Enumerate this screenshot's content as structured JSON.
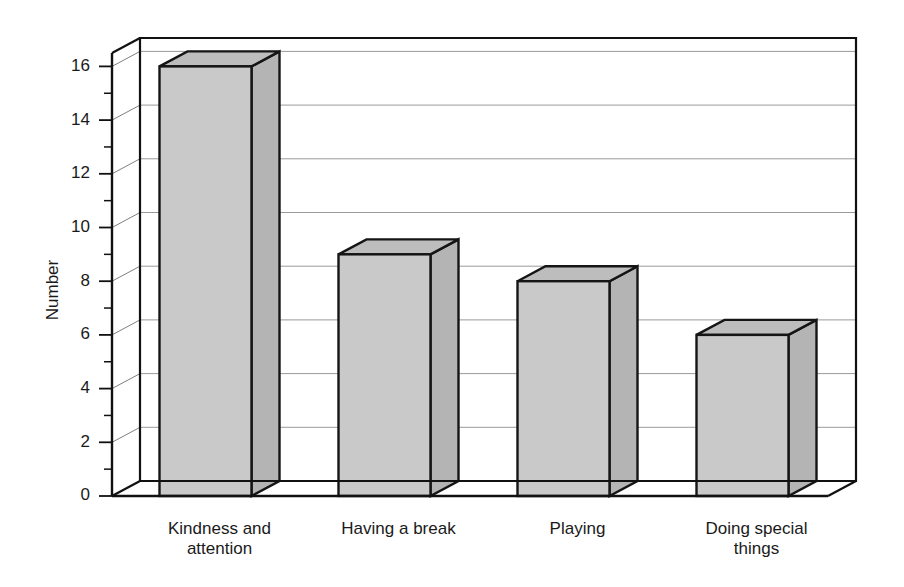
{
  "chart_data": {
    "type": "bar",
    "title": "",
    "subtitle": "",
    "xlabel": "",
    "ylabel": "Number",
    "categories": [
      "Kindness and attention",
      "Having a break",
      "Playing",
      "Doing special things"
    ],
    "category_lines": [
      [
        "Kindness and",
        "attention"
      ],
      [
        "Having a break"
      ],
      [
        "Playing"
      ],
      [
        "Doing special",
        "things"
      ]
    ],
    "values": [
      16,
      9,
      8,
      6
    ],
    "ylim": [
      0,
      16
    ],
    "y_axis_max_drawn": 16.5,
    "y_major_ticks": [
      0,
      2,
      4,
      6,
      8,
      10,
      12,
      14,
      16
    ],
    "y_minor_ticks": [
      1,
      3,
      5,
      7,
      9,
      11,
      13,
      15
    ],
    "y_tick_labels": [
      "0",
      "2",
      "4",
      "6",
      "8",
      "10",
      "12",
      "14",
      "16"
    ],
    "grid": true,
    "grid_axis": "y",
    "legend": null,
    "legend_position": "none",
    "style": "3d-perspective",
    "colors": {
      "bar_front": "#c9c9c9",
      "bar_top": "#bdbdbd",
      "bar_side": "#b4b4b4",
      "bar_edge": "#151515",
      "gridline": "#9a9a9a",
      "axis": "#111111",
      "background": "#ffffff",
      "text": "#1a1a1a"
    }
  }
}
